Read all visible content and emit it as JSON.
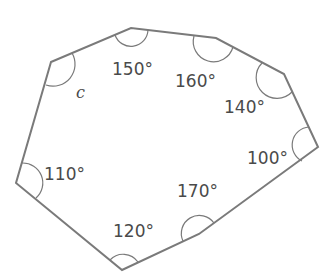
{
  "diagram": {
    "shape": "octagon",
    "stroke_color": "#7a7a7a",
    "text_color": "#4a4a4a",
    "vertices": [
      [
        51,
        62
      ],
      [
        131,
        28
      ],
      [
        216,
        38
      ],
      [
        284,
        74
      ],
      [
        318,
        147
      ],
      [
        199,
        234
      ],
      [
        122,
        270
      ],
      [
        16,
        183
      ]
    ],
    "angles": [
      {
        "vertex": 0,
        "label": "c"
      },
      {
        "vertex": 1,
        "label": "150°"
      },
      {
        "vertex": 2,
        "label": "160°"
      },
      {
        "vertex": 3,
        "label": "140°"
      },
      {
        "vertex": 4,
        "label": "100°"
      },
      {
        "vertex": 5,
        "label": "170°"
      },
      {
        "vertex": 6,
        "label": "120°"
      },
      {
        "vertex": 7,
        "label": "110°"
      }
    ]
  }
}
